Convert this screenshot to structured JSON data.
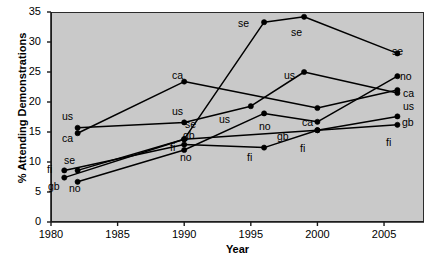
{
  "chart_data": {
    "type": "line",
    "title": "",
    "xlabel": "Year",
    "ylabel": "% Attending Demonstrations",
    "xlim": [
      1980,
      2008
    ],
    "ylim": [
      0,
      35
    ],
    "xticks": [
      1980,
      1985,
      1990,
      1995,
      2000,
      2005
    ],
    "yticks": [
      0,
      5,
      10,
      15,
      20,
      25,
      30,
      35
    ],
    "grid": false,
    "legend": "inline-point-labels",
    "marker": "filled-circle",
    "line_color": "#000000",
    "plot_background": "#c9c9c9",
    "series": [
      {
        "name": "se",
        "label": "se",
        "points": [
          {
            "x": 1982,
            "y": 8.6,
            "label": "se",
            "label_pos": "top"
          },
          {
            "x": 1990,
            "y": 13.8,
            "label": "se",
            "label_pos": "right"
          },
          {
            "x": 1996,
            "y": 33.3,
            "label": "se",
            "label_pos": "left"
          },
          {
            "x": 1999,
            "y": 34.2,
            "label": "se",
            "label_pos": "bottom"
          },
          {
            "x": 2006,
            "y": 28.1,
            "label": "se",
            "label_pos": "top"
          }
        ]
      },
      {
        "name": "us",
        "label": "us",
        "points": [
          {
            "x": 1982,
            "y": 15.7,
            "label": "us",
            "label_pos": "top"
          },
          {
            "x": 1990,
            "y": 16.6,
            "label": "us",
            "label_pos": "top"
          },
          {
            "x": 1995,
            "y": 19.3,
            "label": "us",
            "label_pos": "bottomleft"
          },
          {
            "x": 1999,
            "y": 25.0,
            "label": "us",
            "label_pos": "left"
          },
          {
            "x": 2006,
            "y": 21.5,
            "label": "us",
            "label_pos": "bottomright"
          }
        ]
      },
      {
        "name": "ca",
        "label": "ca",
        "points": [
          {
            "x": 1982,
            "y": 14.8,
            "label": "ca",
            "label_pos": "bottom"
          },
          {
            "x": 1990,
            "y": 23.4,
            "label": "ca",
            "label_pos": "top"
          },
          {
            "x": 2000,
            "y": 19.0,
            "label": "ca",
            "label_pos": "bottomleft"
          },
          {
            "x": 2006,
            "y": 22.0,
            "label": "ca",
            "label_pos": "right"
          }
        ]
      },
      {
        "name": "no",
        "label": "no",
        "points": [
          {
            "x": 1982,
            "y": 6.7,
            "label": "no",
            "label_pos": "bottom"
          },
          {
            "x": 1990,
            "y": 12.0,
            "label": "no",
            "label_pos": "bottom"
          },
          {
            "x": 1996,
            "y": 18.1,
            "label": "no",
            "label_pos": "bottomleft"
          },
          {
            "x": 2000,
            "y": 16.7,
            "label": "no",
            "label_pos": "none"
          },
          {
            "x": 2006,
            "y": 24.3,
            "label": "no",
            "label_pos": "top"
          }
        ]
      },
      {
        "name": "gb",
        "label": "gb",
        "points": [
          {
            "x": 1981,
            "y": 7.4,
            "label": "gb",
            "label_pos": "bottomleft"
          },
          {
            "x": 1990,
            "y": 13.8,
            "label": "gb",
            "label_pos": "topleft"
          },
          {
            "x": 2000,
            "y": 15.3,
            "label": "gb",
            "label_pos": "topleft"
          },
          {
            "x": 2006,
            "y": 17.6,
            "label": "gb",
            "label_pos": "right"
          }
        ]
      },
      {
        "name": "fi",
        "label": "fi",
        "points": [
          {
            "x": 1981,
            "y": 8.6,
            "label": "fi",
            "label_pos": "left"
          },
          {
            "x": 1990,
            "y": 12.9,
            "label": "fi",
            "label_pos": "left"
          },
          {
            "x": 1996,
            "y": 12.4,
            "label": "fi",
            "label_pos": "bottom"
          },
          {
            "x": 2000,
            "y": 15.3,
            "label": "fi",
            "label_pos": "bottom"
          },
          {
            "x": 2006,
            "y": 16.2,
            "label": "fi",
            "label_pos": "bottom"
          }
        ]
      }
    ],
    "point_labels": [
      {
        "text": "us",
        "x": 62,
        "y": 111
      },
      {
        "text": "ca",
        "x": 62,
        "y": 133
      },
      {
        "text": "se",
        "x": 64,
        "y": 155
      },
      {
        "text": "fi",
        "x": 47,
        "y": 164
      },
      {
        "text": "gb",
        "x": 48,
        "y": 181
      },
      {
        "text": "no",
        "x": 69,
        "y": 183
      },
      {
        "text": "ca",
        "x": 172,
        "y": 70
      },
      {
        "text": "us",
        "x": 172,
        "y": 106
      },
      {
        "text": "se",
        "x": 185,
        "y": 119
      },
      {
        "text": "gb",
        "x": 183,
        "y": 130
      },
      {
        "text": "fi",
        "x": 170,
        "y": 142
      },
      {
        "text": "no",
        "x": 180,
        "y": 152
      },
      {
        "text": "se",
        "x": 238,
        "y": 18
      },
      {
        "text": "se",
        "x": 291,
        "y": 27
      },
      {
        "text": "se",
        "x": 392,
        "y": 46
      },
      {
        "text": "us",
        "x": 284,
        "y": 70
      },
      {
        "text": "no",
        "x": 400,
        "y": 71
      },
      {
        "text": "ca",
        "x": 403,
        "y": 88
      },
      {
        "text": "us",
        "x": 403,
        "y": 101
      },
      {
        "text": "us",
        "x": 219,
        "y": 114
      },
      {
        "text": "no",
        "x": 259,
        "y": 121
      },
      {
        "text": "ca",
        "x": 302,
        "y": 117
      },
      {
        "text": "gb",
        "x": 277,
        "y": 131
      },
      {
        "text": "gb",
        "x": 402,
        "y": 117
      },
      {
        "text": "fi",
        "x": 300,
        "y": 143
      },
      {
        "text": "fi",
        "x": 386,
        "y": 137
      },
      {
        "text": "fi",
        "x": 247,
        "y": 152
      }
    ]
  }
}
